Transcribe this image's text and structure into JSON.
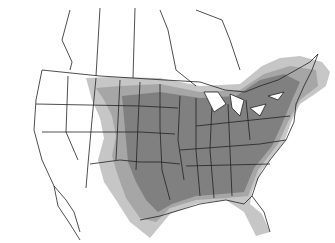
{
  "map": {
    "type": "species range map",
    "region": "North America (United States, southern Canada, northern Mexico)",
    "labels": [],
    "colors": {
      "background": "#ffffff",
      "border": "#222222",
      "range_light": "#c4c4c4",
      "range_medium": "#a4a4a4",
      "range_dark": "#7e7e7e"
    },
    "legend": null
  }
}
